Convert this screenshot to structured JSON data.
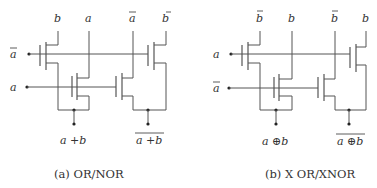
{
  "circuit_a": {
    "rail_labels": [
      "b",
      "a",
      "a",
      "b"
    ],
    "rail_bars": [
      false,
      false,
      true,
      true
    ],
    "inputs": [
      {
        "label": "a",
        "bar": true
      },
      {
        "label": "a",
        "bar": false
      }
    ],
    "outputs": [
      {
        "label": "a +b",
        "bar": false
      },
      {
        "label": "a +b",
        "bar": true
      }
    ],
    "caption": "(a) OR/NOR"
  },
  "circuit_b": {
    "rail_labels": [
      "b",
      "b",
      "b",
      "b"
    ],
    "rail_bars": [
      true,
      false,
      true,
      false
    ],
    "inputs": [
      {
        "label": "a",
        "bar": false
      },
      {
        "label": "a",
        "bar": true
      }
    ],
    "outputs": [
      {
        "label": "a ⊕b",
        "bar": false
      },
      {
        "label": "a ⊕b",
        "bar": true
      }
    ],
    "caption": "(b) X OR/XNOR"
  },
  "colors": {
    "wire": "#555555",
    "text": "#333333",
    "background": "#ffffff"
  }
}
